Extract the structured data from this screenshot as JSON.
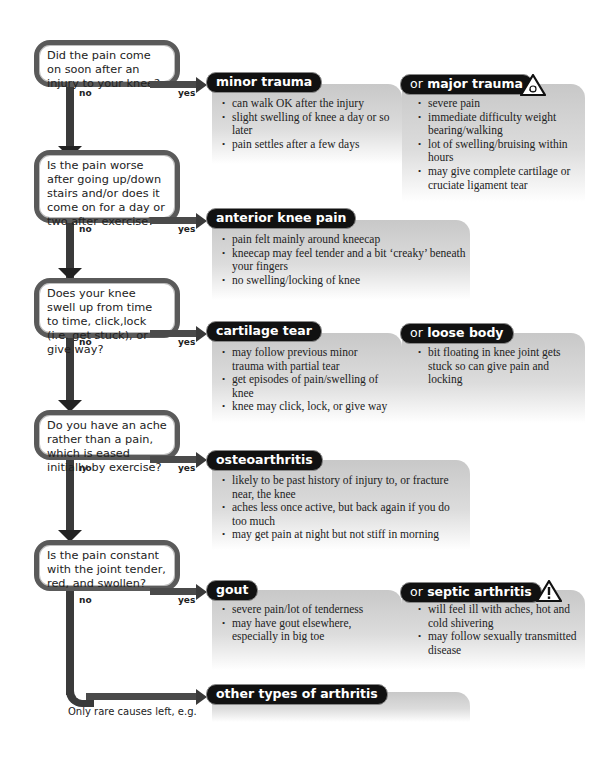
{
  "labels": {
    "no": "no",
    "yes": "yes",
    "or": "or"
  },
  "questions": [
    {
      "text": "Did the pain come on soon after an injury to your knee?"
    },
    {
      "text": "Is the pain worse after going up/down stairs and/or does it come on for a day or two after exercise?"
    },
    {
      "text": "Does your knee swell up from time to time, click,lock (i.e. get stuck), or give way?"
    },
    {
      "text": "Do you have an ache rather than a pain, which is eased initially by exercise?"
    },
    {
      "text": "Is the pain constant with the joint tender, red, and swollen?"
    }
  ],
  "outcomes": [
    {
      "primary": {
        "title": "minor trauma",
        "bullets": [
          "can walk OK after the injury",
          "slight swelling of knee a day or so later",
          "pain settles after a few days"
        ]
      },
      "alternative": {
        "title": "major trauma",
        "icon": "warning-triangle-icon",
        "bullets": [
          "severe pain",
          "immediate difficulty weight bearing/walking",
          "lot of swelling/bruising within hours",
          "may give complete cartilage or cruciate ligament tear"
        ]
      }
    },
    {
      "primary": {
        "title": "anterior knee pain",
        "bullets": [
          "pain felt mainly around kneecap",
          "kneecap may feel tender and a bit ‘creaky’ beneath your fingers",
          "no swelling/locking of knee"
        ]
      }
    },
    {
      "primary": {
        "title": "cartilage tear",
        "bullets": [
          "may follow previous minor trauma with partial tear",
          "get episodes of pain/swelling of knee",
          "knee may click, lock, or give way"
        ]
      },
      "alternative": {
        "title": "loose body",
        "bullets": [
          "bit floating in knee joint gets stuck so can give pain and locking"
        ]
      }
    },
    {
      "primary": {
        "title": "osteoarthritis",
        "bullets": [
          "likely to be past history of injury to, or fracture near, the knee",
          "aches less once active, but back again if you do too much",
          "may get pain at night but not stiff in morning"
        ]
      }
    },
    {
      "primary": {
        "title": "gout",
        "bullets": [
          "severe pain/lot of tenderness",
          "may have gout elsewhere, especially in big toe"
        ]
      },
      "alternative": {
        "title": "septic arthritis",
        "icon": "warning-triangle-icon",
        "bullets": [
          "will feel ill with aches, hot and cold shivering",
          "may follow sexually transmitted disease"
        ]
      }
    },
    {
      "primary": {
        "title": "other types of arthritis"
      }
    }
  ],
  "footnote": "Only rare causes left, e.g."
}
